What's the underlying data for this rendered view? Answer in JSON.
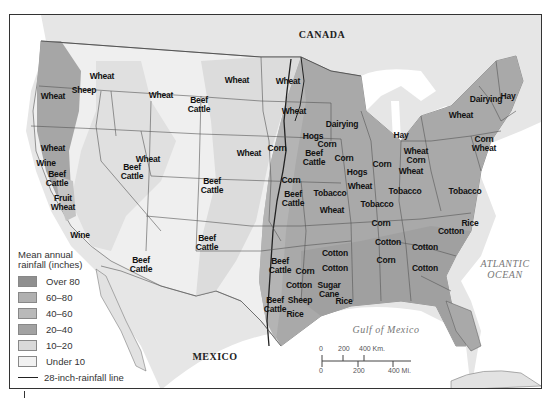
{
  "map": {
    "title_labels": {
      "canada": "CANADA",
      "mexico": "MEXICO",
      "atlantic": "ATLANTIC\nOCEAN",
      "gulf": "Gulf of Mexico"
    },
    "colors": {
      "over80": "#8f8f8f",
      "r60_80": "#a9a9a9",
      "r40_60": "#b7b7b7",
      "r20_40": "#a3a3a3",
      "r10_20": "#dadada",
      "under10": "#efefef",
      "land_outside": "#e2e2e2",
      "water": "#ffffff",
      "border": "#555555",
      "rain_line": "#222222"
    },
    "crop_labels": [
      {
        "text": "Wheat",
        "x": 101,
        "y": 75
      },
      {
        "text": "Sheep",
        "x": 83,
        "y": 89
      },
      {
        "text": "Wheat",
        "x": 52,
        "y": 95
      },
      {
        "text": "Wheat",
        "x": 160,
        "y": 94
      },
      {
        "text": "Beef\nCattle",
        "x": 198,
        "y": 104
      },
      {
        "text": "Wheat",
        "x": 236,
        "y": 79
      },
      {
        "text": "Wheat",
        "x": 287,
        "y": 80
      },
      {
        "text": "Wheat",
        "x": 293,
        "y": 110
      },
      {
        "text": "Dairying",
        "x": 341,
        "y": 123
      },
      {
        "text": "Hay",
        "x": 400,
        "y": 134
      },
      {
        "text": "Dairying",
        "x": 485,
        "y": 98
      },
      {
        "text": "Hay",
        "x": 507,
        "y": 95
      },
      {
        "text": "Wheat",
        "x": 460,
        "y": 114
      },
      {
        "text": "Corn\nWheat",
        "x": 483,
        "y": 143
      },
      {
        "text": "Wheat",
        "x": 52,
        "y": 147
      },
      {
        "text": "Wine",
        "x": 45,
        "y": 162
      },
      {
        "text": "Beef\nCattle",
        "x": 56,
        "y": 178
      },
      {
        "text": "Fruit\nWheat",
        "x": 62,
        "y": 202
      },
      {
        "text": "Wine",
        "x": 79,
        "y": 234
      },
      {
        "text": "Wheat",
        "x": 147,
        "y": 158
      },
      {
        "text": "Beef\nCattle",
        "x": 131,
        "y": 171
      },
      {
        "text": "Wheat",
        "x": 248,
        "y": 152
      },
      {
        "text": "Beef\nCattle",
        "x": 211,
        "y": 185
      },
      {
        "text": "Beef\nCattle",
        "x": 206,
        "y": 242
      },
      {
        "text": "Beef\nCattle",
        "x": 140,
        "y": 264
      },
      {
        "text": "Corn",
        "x": 276,
        "y": 147
      },
      {
        "text": "Hogs",
        "x": 312,
        "y": 135
      },
      {
        "text": "Corn",
        "x": 326,
        "y": 143
      },
      {
        "text": "Beef\nCattle",
        "x": 313,
        "y": 157
      },
      {
        "text": "Corn",
        "x": 343,
        "y": 157
      },
      {
        "text": "Hogs",
        "x": 356,
        "y": 171
      },
      {
        "text": "Wheat",
        "x": 359,
        "y": 185
      },
      {
        "text": "Corn",
        "x": 381,
        "y": 163
      },
      {
        "text": "Wheat\nCorn",
        "x": 415,
        "y": 155
      },
      {
        "text": "Wheat",
        "x": 410,
        "y": 170
      },
      {
        "text": "Tobacco",
        "x": 404,
        "y": 190
      },
      {
        "text": "Tobacco",
        "x": 376,
        "y": 203
      },
      {
        "text": "Tobacco",
        "x": 464,
        "y": 190
      },
      {
        "text": "Corn",
        "x": 290,
        "y": 179
      },
      {
        "text": "Beef\nCattle",
        "x": 292,
        "y": 198
      },
      {
        "text": "Tobacco",
        "x": 329,
        "y": 192
      },
      {
        "text": "Wheat",
        "x": 331,
        "y": 209
      },
      {
        "text": "Corn",
        "x": 380,
        "y": 222
      },
      {
        "text": "Rice",
        "x": 469,
        "y": 222
      },
      {
        "text": "Cotton",
        "x": 450,
        "y": 230
      },
      {
        "text": "Cotton",
        "x": 387,
        "y": 241
      },
      {
        "text": "Cotton",
        "x": 334,
        "y": 252
      },
      {
        "text": "Corn",
        "x": 385,
        "y": 259
      },
      {
        "text": "Cotton",
        "x": 424,
        "y": 246
      },
      {
        "text": "Cotton",
        "x": 424,
        "y": 267
      },
      {
        "text": "Cotton",
        "x": 334,
        "y": 267
      },
      {
        "text": "Beef\nCattle",
        "x": 279,
        "y": 265
      },
      {
        "text": "Corn",
        "x": 304,
        "y": 270
      },
      {
        "text": "Cotton",
        "x": 298,
        "y": 284
      },
      {
        "text": "Sugar\nCane",
        "x": 328,
        "y": 289
      },
      {
        "text": "Beef\nCattle",
        "x": 274,
        "y": 304
      },
      {
        "text": "Sheep",
        "x": 299,
        "y": 299
      },
      {
        "text": "Rice",
        "x": 343,
        "y": 300
      },
      {
        "text": "Rice",
        "x": 294,
        "y": 313
      }
    ]
  },
  "legend": {
    "title": "Mean annual\nrainfall (inches)",
    "items": [
      {
        "label": "Over 80",
        "color": "#8f8f8f"
      },
      {
        "label": "60–80",
        "color": "#b0b0b0"
      },
      {
        "label": "40–60",
        "color": "#b9b9b9"
      },
      {
        "label": "20–40",
        "color": "#a2a2a2"
      },
      {
        "label": "10–20",
        "color": "#d9d9d9"
      },
      {
        "label": "Under 10",
        "color": "#f1f1f1"
      }
    ],
    "line_label": "28-inch-rainfall line"
  },
  "scale_bar": {
    "km_labels": [
      "0",
      "200",
      "400 Km."
    ],
    "mi_labels": [
      "0",
      "200",
      "400 Mi."
    ]
  }
}
